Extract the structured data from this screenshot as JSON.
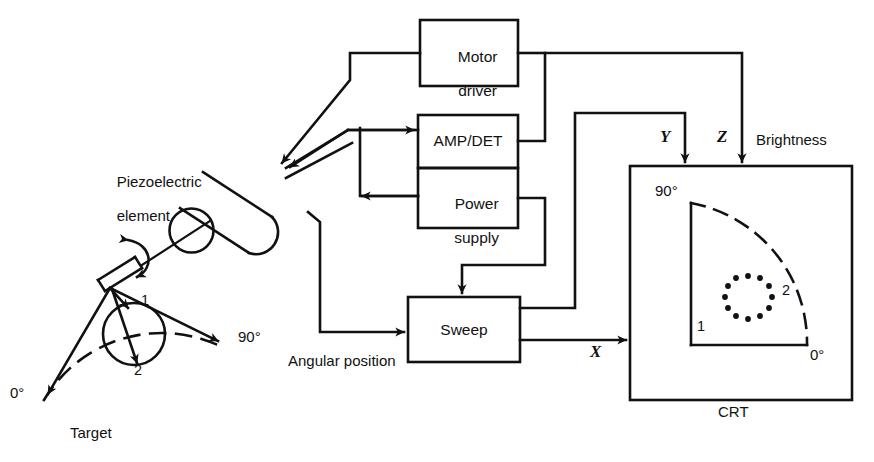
{
  "diagram": {
    "blocks": [
      {
        "id": "motor_driver",
        "label": "Motor\ndriver",
        "line1": "Motor",
        "line2": "driver"
      },
      {
        "id": "amp_det",
        "label": "AMP/DET",
        "line1": "AMP/DET",
        "line2": ""
      },
      {
        "id": "power_supply",
        "label": "Power\nsupply",
        "line1": "Power",
        "line2": "supply"
      },
      {
        "id": "sweep",
        "label": "Sweep",
        "line1": "Sweep",
        "line2": ""
      }
    ],
    "labels": {
      "piezo_line1": "Piezoelectric",
      "piezo_line2": "element",
      "target": "Target",
      "angular_position": "Angular position",
      "crt": "CRT",
      "brightness": "Brightness",
      "signal_x": "X",
      "signal_y": "Y",
      "signal_z": "Z",
      "scan_zero": "0°",
      "scan_ninety": "90°",
      "beam_one": "1",
      "beam_two": "2",
      "crt_zero": "0°",
      "crt_ninety": "90°",
      "crt_one": "1",
      "crt_two": "2"
    },
    "colors": {
      "ink": "#111111",
      "background": "#ffffff"
    }
  }
}
